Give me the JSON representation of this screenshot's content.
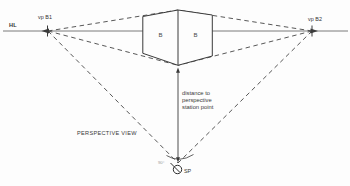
{
  "diagram": {
    "labels": {
      "horizon": "HL",
      "vp_left": "vp B1",
      "vp_right": "vp B2",
      "box_left_face": "B",
      "box_right_face": "B",
      "distance_line1": "distance to",
      "distance_line2": "perspective",
      "distance_line3": "station point",
      "view_caption": "PERSPECTIVE VIEW",
      "station_point": "SP",
      "angle": "90°"
    },
    "colors": {
      "background": "#fdfdfd",
      "horizon_line": "#7a7a7a",
      "construction_line": "#444444",
      "box_outline": "#3a3a3a",
      "text": "#333333",
      "muted_text": "#9a9a9a"
    }
  }
}
